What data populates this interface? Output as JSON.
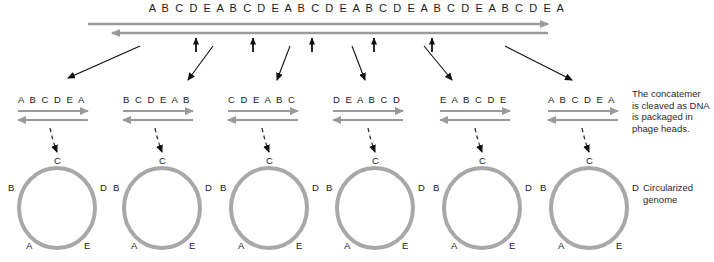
{
  "diagram": {
    "concatemer": {
      "sequence": "A B C D E A B C D E A B C D E A B C D E A B C D E A B C D E A",
      "strand_right_name": "top-strand-right-arrow",
      "strand_left_name": "bottom-strand-left-arrow"
    },
    "cleavage_note": "The concatemer is cleaved as DNA is packaged in phage heads.",
    "circularized_note": "Circularized genome",
    "fragments": [
      {
        "label": "A B C D E A"
      },
      {
        "label": "B C D E A B"
      },
      {
        "label": "C D E A B C"
      },
      {
        "label": "D E A B C D"
      },
      {
        "label": "E A B C D E"
      },
      {
        "label": "A B C D E A"
      }
    ],
    "genome_ring": {
      "top": "C",
      "left": "B",
      "right": "D",
      "bottom_left": "A",
      "bottom_right": "E"
    },
    "colors": {
      "strand_gray": "#9a9a9a",
      "ring_gray": "#a8a8a8",
      "arrow_black": "#111111",
      "text_dark": "#1a1a1a"
    }
  }
}
